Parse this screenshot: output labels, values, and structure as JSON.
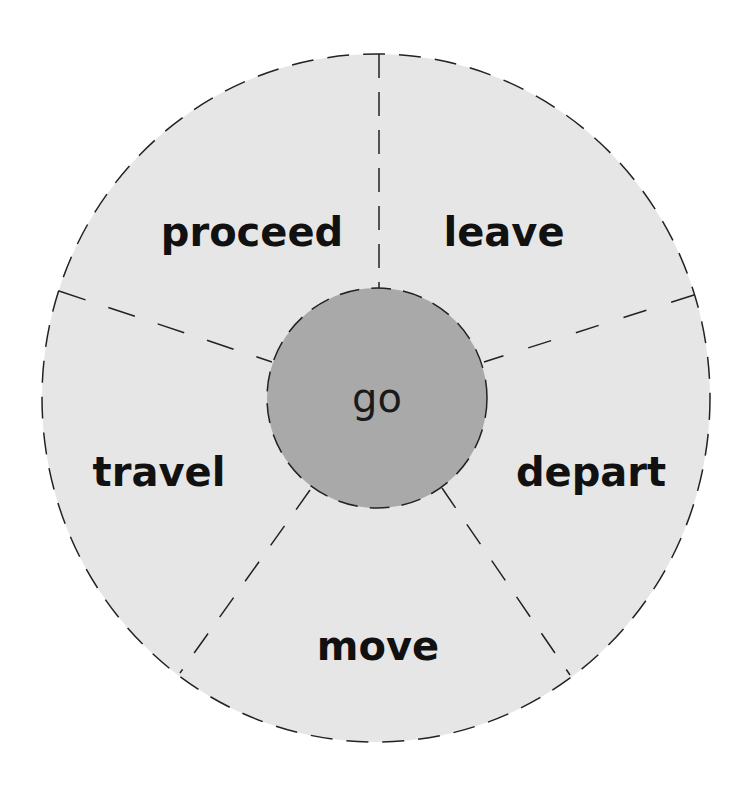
{
  "diagram": {
    "type": "word-wheel",
    "center": {
      "label": "go",
      "color": "#a9a9a9"
    },
    "ring_color": "#e6e6e6",
    "line_color": "#222222",
    "segments": [
      {
        "label": "leave"
      },
      {
        "label": "depart"
      },
      {
        "label": "move"
      },
      {
        "label": "travel"
      },
      {
        "label": "proceed"
      }
    ]
  }
}
